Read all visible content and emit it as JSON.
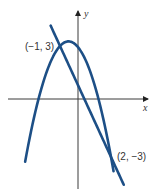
{
  "diagram": {
    "type": "coordinate-plane-graph",
    "axes": {
      "x_label": "x",
      "y_label": "y",
      "color": "#3a3a3a"
    },
    "curves": [
      {
        "name": "parabola",
        "equation": "y = -x^2 - x + 3",
        "color": "#1d4f86",
        "x_range": [
          -3.05,
          2.15
        ]
      },
      {
        "name": "line",
        "equation": "y = -2x + 1",
        "color": "#1d4f86",
        "x_range": [
          -1.55,
          2.75
        ]
      }
    ],
    "points": [
      {
        "label": "(−1, 3)",
        "x": -1,
        "y": 3
      },
      {
        "label": "(2, −3)",
        "x": 2,
        "y": -3
      }
    ]
  },
  "chart_data": {
    "type": "line",
    "title": "",
    "xlabel": "x",
    "ylabel": "y",
    "series": [
      {
        "name": "parabola y = -x^2 - x + 3",
        "x": [
          -3,
          -2,
          -1,
          -0.5,
          0,
          1,
          2
        ],
        "values": [
          -3,
          1,
          3,
          3.25,
          3,
          1,
          -3
        ]
      },
      {
        "name": "line y = -2x + 1",
        "x": [
          -1.5,
          -1,
          0,
          1,
          2,
          2.7
        ],
        "values": [
          4,
          3,
          1,
          -1,
          -3,
          -4.4
        ]
      }
    ],
    "annotations": [
      "(−1, 3)",
      "(2, −3)"
    ],
    "grid": false
  }
}
